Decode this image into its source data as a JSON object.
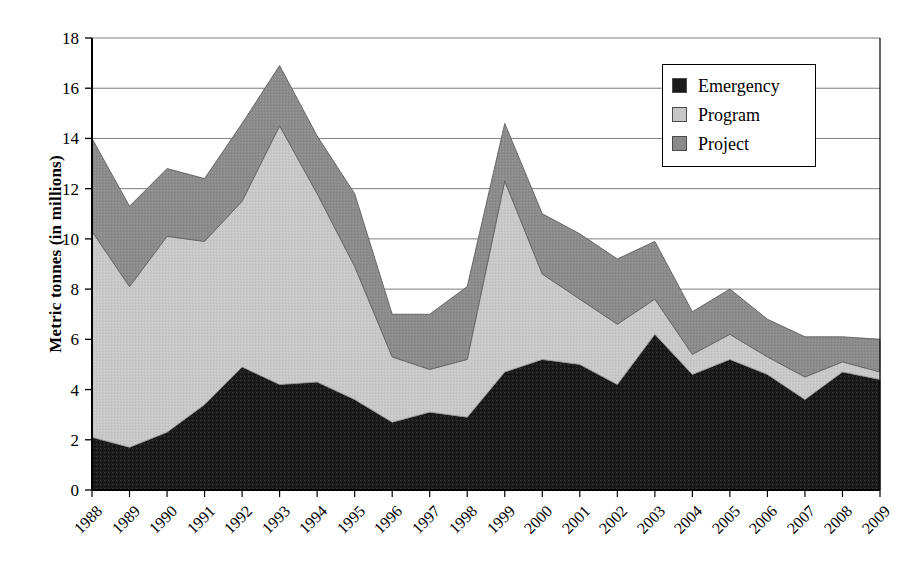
{
  "chart_data": {
    "type": "area",
    "stacked": true,
    "title": "",
    "xlabel": "",
    "ylabel": "Metric tonnes (in millions)",
    "ylim": [
      0,
      18
    ],
    "ytick_step": 2,
    "yticks": [
      "0",
      "2",
      "4",
      "6",
      "8",
      "10",
      "12",
      "14",
      "16",
      "18"
    ],
    "grid": "horizontal",
    "legend_position": "top-right",
    "categories": [
      "1988",
      "1989",
      "1990",
      "1991",
      "1992",
      "1993",
      "1994",
      "1995",
      "1996",
      "1997",
      "1998",
      "1999",
      "2000",
      "2001",
      "2002",
      "2003",
      "2004",
      "2005",
      "2006",
      "2007",
      "2008",
      "2009"
    ],
    "series": [
      {
        "name": "Emergency",
        "color": "#1a1a1a",
        "values": [
          2.1,
          1.7,
          2.3,
          3.4,
          4.9,
          4.2,
          4.3,
          3.6,
          2.7,
          3.1,
          2.9,
          4.7,
          5.2,
          5.0,
          4.2,
          6.2,
          4.6,
          5.2,
          4.6,
          3.6,
          4.7,
          4.4
        ]
      },
      {
        "name": "Program",
        "color": "#c6c6c6",
        "values": [
          8.2,
          6.4,
          7.8,
          6.5,
          6.6,
          10.3,
          7.5,
          5.3,
          2.6,
          1.7,
          2.3,
          7.6,
          3.4,
          2.6,
          2.4,
          1.4,
          0.8,
          1.0,
          0.7,
          0.9,
          0.4,
          0.3
        ]
      },
      {
        "name": "Project",
        "color": "#8a8a8a",
        "values": [
          3.7,
          3.2,
          2.7,
          2.5,
          3.1,
          2.4,
          2.3,
          2.9,
          1.7,
          2.2,
          2.9,
          2.3,
          2.4,
          2.6,
          2.6,
          2.3,
          1.7,
          1.8,
          1.5,
          1.6,
          1.0,
          1.3
        ]
      }
    ],
    "totals": [
      14.0,
      11.3,
      12.8,
      12.4,
      14.6,
      16.9,
      14.1,
      11.8,
      7.0,
      7.0,
      8.1,
      14.6,
      11.0,
      10.2,
      9.2,
      9.9,
      7.1,
      8.0,
      6.8,
      6.1,
      6.1,
      6.0
    ],
    "program_tops": [
      10.3,
      8.1,
      10.1,
      9.9,
      11.5,
      14.5,
      11.8,
      8.9,
      5.3,
      4.8,
      5.2,
      12.3,
      8.6,
      7.6,
      6.6,
      7.6,
      5.4,
      6.2,
      5.3,
      4.5,
      5.1,
      4.7
    ]
  },
  "legend": {
    "items": [
      {
        "label": "Emergency",
        "color": "#1a1a1a"
      },
      {
        "label": "Program",
        "color": "#c6c6c6"
      },
      {
        "label": "Project",
        "color": "#8a8a8a"
      }
    ]
  }
}
